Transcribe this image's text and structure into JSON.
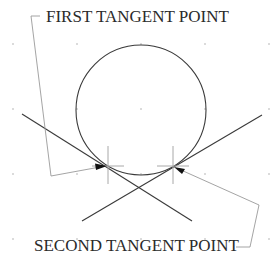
{
  "diagram": {
    "labels": {
      "first": "FIRST TANGENT POINT",
      "second": "SECOND TANGENT POINT"
    },
    "colors": {
      "background": "#ffffff",
      "geometry": "#3a3a3a",
      "leader": "#9a9a9a",
      "crosshair": "#a8a8a8",
      "grid": "#b8b8b8",
      "text": "#2a2a2a"
    },
    "grid": {
      "xs": [
        13,
        77,
        141,
        205,
        269
      ],
      "ys": [
        44,
        109,
        174,
        239
      ]
    },
    "circle": {
      "cx": 141,
      "cy": 110,
      "r": 65
    },
    "lines": [
      {
        "name": "line-1",
        "x1": 22,
        "y1": 114,
        "x2": 192,
        "y2": 221
      },
      {
        "name": "line-2",
        "x1": 262,
        "y1": 115,
        "x2": 82,
        "y2": 221
      }
    ],
    "tangent_points": [
      {
        "name": "first",
        "x": 108,
        "y": 166
      },
      {
        "name": "second",
        "x": 173,
        "y": 166
      }
    ]
  }
}
